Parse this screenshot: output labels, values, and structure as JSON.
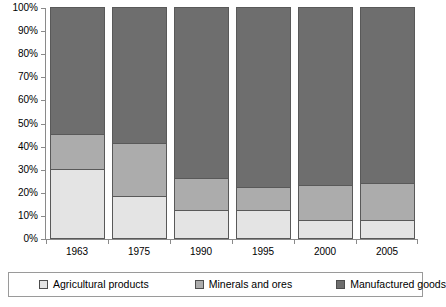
{
  "chart_data": {
    "type": "bar",
    "stacked": true,
    "stack_mode": "percent",
    "title": "",
    "subtitle": "",
    "xlabel": "",
    "ylabel": "",
    "categories": [
      "1963",
      "1975",
      "1990",
      "1995",
      "2000",
      "2005"
    ],
    "series": [
      {
        "name": "Agricultural products",
        "color": "#e4e4e4",
        "values": [
          30,
          18,
          12,
          12,
          8,
          8
        ]
      },
      {
        "name": "Minerals and ores",
        "color": "#acacac",
        "values": [
          15,
          23,
          14,
          10,
          15,
          16
        ]
      },
      {
        "name": "Manufactured goods",
        "color": "#6e6e6e",
        "values": [
          55,
          59,
          74,
          78,
          77,
          76
        ]
      }
    ],
    "cumulative_tops": [
      {
        "category": "1963",
        "agricultural_top": 30,
        "minerals_top": 45,
        "manufactured_top": 100
      },
      {
        "category": "1975",
        "agricultural_top": 18,
        "minerals_top": 41,
        "manufactured_top": 100
      },
      {
        "category": "1990",
        "agricultural_top": 12,
        "minerals_top": 26,
        "manufactured_top": 100
      },
      {
        "category": "1995",
        "agricultural_top": 12,
        "minerals_top": 22,
        "manufactured_top": 100
      },
      {
        "category": "2000",
        "agricultural_top": 8,
        "minerals_top": 23,
        "manufactured_top": 100
      },
      {
        "category": "2005",
        "agricultural_top": 8,
        "minerals_top": 24,
        "manufactured_top": 100
      }
    ],
    "ylim": [
      0,
      100
    ],
    "y_ticks": [
      0,
      10,
      20,
      30,
      40,
      50,
      60,
      70,
      80,
      90,
      100
    ],
    "y_tick_labels": [
      "0%",
      "10%",
      "20%",
      "30%",
      "40%",
      "50%",
      "60%",
      "70%",
      "80%",
      "90%",
      "100%"
    ],
    "grid": false,
    "legend_position": "bottom"
  },
  "legend": {
    "items": [
      {
        "label": "Agricultural products",
        "color": "#e4e4e4"
      },
      {
        "label": "Minerals and ores",
        "color": "#acacac"
      },
      {
        "label": "Manufactured goods",
        "color": "#6e6e6e"
      }
    ]
  }
}
